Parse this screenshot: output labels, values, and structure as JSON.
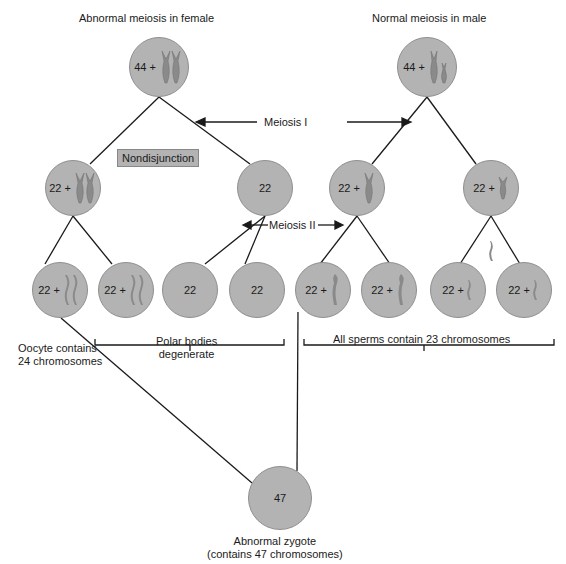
{
  "titles": {
    "female": "Abnormal meiosis in female",
    "male": "Normal meiosis in male"
  },
  "labels": {
    "meiosis1": "Meiosis I",
    "meiosis2": "Meiosis II",
    "nondisjunction": "Nondisjunction",
    "oocyte": [
      "Oocyte contains",
      "24 chromosomes"
    ],
    "polar": [
      "Polar bodies",
      "degenerate"
    ],
    "sperms": "All sperms contain 23 chromosomes",
    "zygote": [
      "Abnormal zygote",
      "(contains 47 chromosomes)"
    ]
  },
  "cells": {
    "female_top": "44 +",
    "male_top": "44 +",
    "female_m1_left": "22 +",
    "female_m1_right": "22",
    "male_m1_left": "22 +",
    "male_m1_right": "22 +",
    "b1": "22 +",
    "b2": "22 +",
    "b3": "22",
    "b4": "22",
    "b5": "22 +",
    "b6": "22 +",
    "b7": "22 +",
    "b8": "22 +",
    "zygote": "47"
  },
  "colors": {
    "cell_fill": "#b3b3b3",
    "chromosome": "#8a8a8a"
  }
}
